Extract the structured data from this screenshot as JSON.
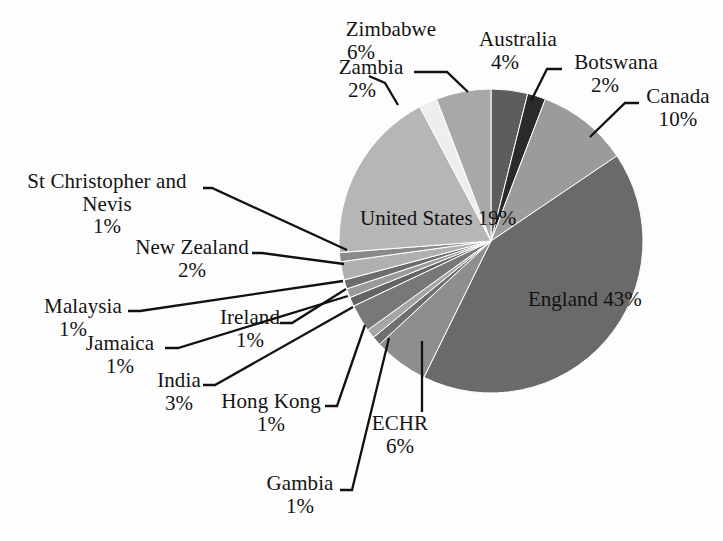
{
  "chart_data": {
    "type": "pie",
    "title": "",
    "xlabel": "",
    "ylabel": "",
    "legend_position": "none",
    "grid": false,
    "units": "percent",
    "start_angle_deg": 0,
    "direction": "clockwise",
    "categories": [
      "Australia",
      "Botswana",
      "Canada",
      "England",
      "ECHR",
      "Gambia",
      "Hong Kong",
      "India",
      "Jamaica",
      "Malaysia",
      "Ireland",
      "New Zealand",
      "St Christopher and Nevis",
      "United States",
      "Zambia",
      "Zimbabwe"
    ],
    "values": [
      4,
      2,
      10,
      43,
      6,
      1,
      1,
      3,
      1,
      1,
      1,
      2,
      1,
      19,
      2,
      6
    ],
    "slices": [
      {
        "label": "Australia",
        "display_label": "Australia",
        "value": 4,
        "pct_text": "4%",
        "color": "#5d5d5d"
      },
      {
        "label": "Botswana",
        "display_label": "Botswana",
        "value": 2,
        "pct_text": "2%",
        "color": "#2a2a2a"
      },
      {
        "label": "Canada",
        "display_label": "Canada",
        "value": 10,
        "pct_text": "10%",
        "color": "#9b9b9b"
      },
      {
        "label": "England",
        "display_label": "England",
        "value": 43,
        "pct_text": "43%",
        "color": "#6a6a6a"
      },
      {
        "label": "ECHR",
        "display_label": "ECHR",
        "value": 6,
        "pct_text": "6%",
        "color": "#8e8e8e"
      },
      {
        "label": "Gambia",
        "display_label": "Gambia",
        "value": 1,
        "pct_text": "1%",
        "color": "#6f6f6f"
      },
      {
        "label": "Hong Kong",
        "display_label": "Hong Kong",
        "value": 1,
        "pct_text": "1%",
        "color": "#a5a5a5"
      },
      {
        "label": "India",
        "display_label": "India",
        "value": 3,
        "pct_text": "3%",
        "color": "#787878"
      },
      {
        "label": "Jamaica",
        "display_label": "Jamaica",
        "value": 1,
        "pct_text": "1%",
        "color": "#636363"
      },
      {
        "label": "Malaysia",
        "display_label": "Malaysia",
        "value": 1,
        "pct_text": "1%",
        "color": "#9a9a9a"
      },
      {
        "label": "Ireland",
        "display_label": "Ireland",
        "value": 1,
        "pct_text": "1%",
        "color": "#6c6c6c"
      },
      {
        "label": "New Zealand",
        "display_label": "New Zealand",
        "value": 2,
        "pct_text": "2%",
        "color": "#b0b0b0"
      },
      {
        "label": "St Christopher and Nevis",
        "display_label": "St Christopher and",
        "display_label2": "Nevis",
        "value": 1,
        "pct_text": "1%",
        "color": "#8a8a8a"
      },
      {
        "label": "United States",
        "display_label": "United States",
        "value": 19,
        "pct_text": "19%",
        "color": "#b6b6b6"
      },
      {
        "label": "Zambia",
        "display_label": "Zambia",
        "value": 2,
        "pct_text": "2%",
        "color": "#eeeeee"
      },
      {
        "label": "Zimbabwe",
        "display_label": "Zimbabwe",
        "value": 6,
        "pct_text": "6%",
        "color": "#a8a8a8"
      }
    ]
  },
  "labels": {
    "zimbabwe": {
      "name": "Zimbabwe",
      "pct": "6%"
    },
    "australia": {
      "name": "Australia",
      "pct": "4%"
    },
    "botswana": {
      "name": "Botswana",
      "pct": "2%"
    },
    "canada": {
      "name": "Canada",
      "pct": "10%"
    },
    "zambia": {
      "name": "Zambia",
      "pct": "2%"
    },
    "stchris": {
      "name": "St Christopher and",
      "name2": "Nevis",
      "pct": "1%"
    },
    "newzealand": {
      "name": "New Zealand",
      "pct": "2%"
    },
    "malaysia": {
      "name": "Malaysia",
      "pct": "1%"
    },
    "ireland": {
      "name": "Ireland",
      "pct": "1%"
    },
    "jamaica": {
      "name": "Jamaica",
      "pct": "1%"
    },
    "india": {
      "name": "India",
      "pct": "3%"
    },
    "hongkong": {
      "name": "Hong Kong",
      "pct": "1%"
    },
    "echr": {
      "name": "ECHR",
      "pct": "6%"
    },
    "gambia": {
      "name": "Gambia",
      "pct": "1%"
    },
    "unitedstates": {
      "name": "United States",
      "pct": "19%"
    },
    "england": {
      "name": "England",
      "pct": "43%"
    }
  },
  "geometry": {
    "center_x": 491,
    "center_y": 241,
    "radius": 152
  }
}
